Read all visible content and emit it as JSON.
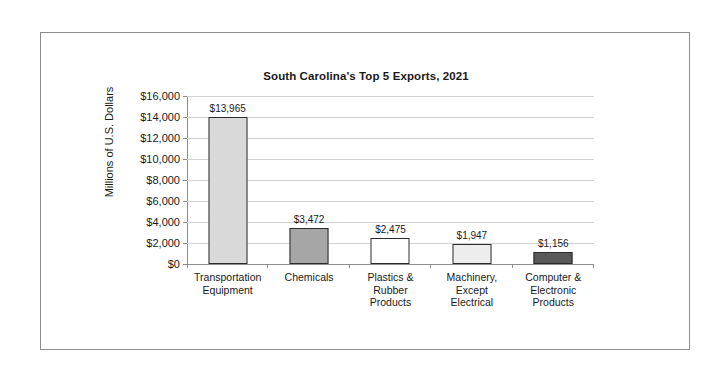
{
  "chart_data": {
    "type": "bar",
    "title": "South Carolina's Top 5 Exports, 2021",
    "xlabel": "",
    "ylabel": "Millions of U.S. Dollars",
    "categories": [
      "Transportation Equipment",
      "Chemicals",
      "Plastics & Rubber Products",
      "Machinery, Except Electrical",
      "Computer & Electronic Products"
    ],
    "category_lines": [
      [
        "Transportation",
        "Equipment"
      ],
      [
        "Chemicals"
      ],
      [
        "Plastics &",
        "Rubber",
        "Products"
      ],
      [
        "Machinery,",
        "Except",
        "Electrical"
      ],
      [
        "Computer &",
        "Electronic",
        "Products"
      ]
    ],
    "values": [
      13965,
      3472,
      2475,
      1947,
      1156
    ],
    "value_labels": [
      "$13,965",
      "$3,472",
      "$2,475",
      "$1,947",
      "$1,156"
    ],
    "bar_colors": [
      "#d9d9d9",
      "#a6a6a6",
      "#ffffff",
      "#ededed",
      "#595959"
    ],
    "bar_border_color": "#2b2b2b",
    "ylim": [
      0,
      16000
    ],
    "ytick_values": [
      16000,
      14000,
      12000,
      10000,
      8000,
      6000,
      4000,
      2000,
      0
    ],
    "ytick_labels": [
      "$16,000",
      "$14,000",
      "$12,000",
      "$10,000",
      "$8,000",
      "$6,000",
      "$4,000",
      "$2,000",
      "$0"
    ],
    "grid": true,
    "gridline_color": "#d2d2d2",
    "axis_color": "#8d8d8d",
    "legend": null,
    "legend_position": "none"
  },
  "frame": {
    "border_color": "#8d8d8d",
    "background": "#ffffff"
  }
}
